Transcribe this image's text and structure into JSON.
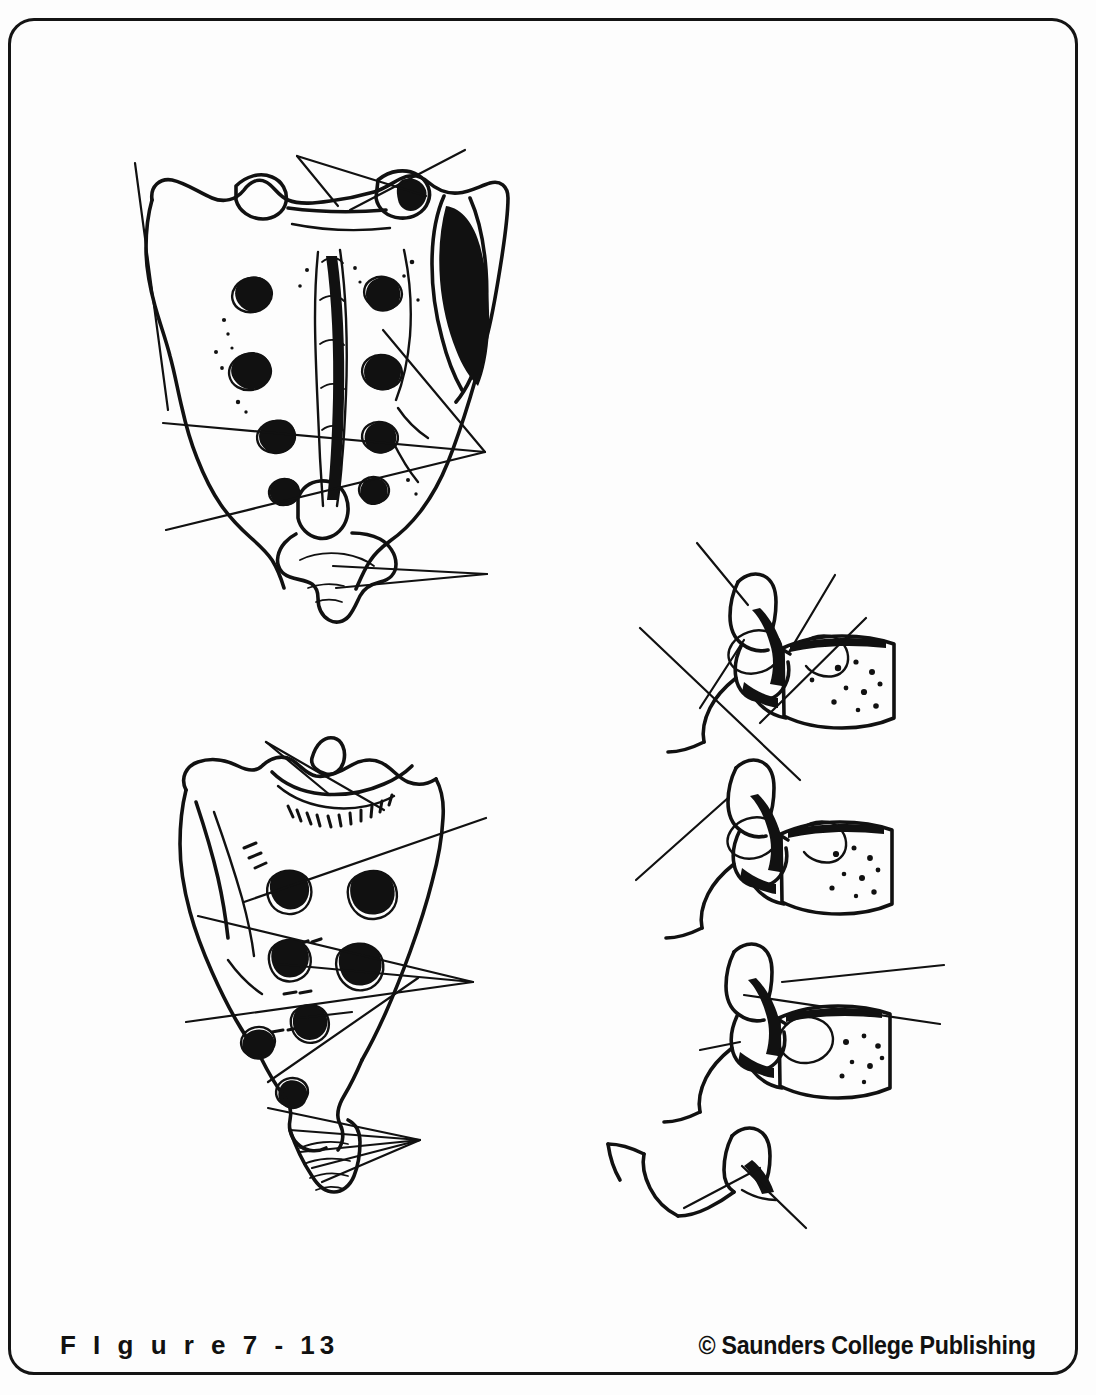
{
  "page": {
    "width": 1096,
    "height": 1395,
    "background_color": "#fdfdfd",
    "ink_color": "#111111",
    "border_color": "#141414"
  },
  "caption": {
    "figure_number": "F I g u r e   7 - 13",
    "copyright": "© Saunders College Publishing"
  },
  "figure": {
    "title_alt": "Unlabeled anatomy plate: sacrum and lumbar vertebrae with blank leader lines",
    "panels": [
      {
        "name": "sacrum-posterior-view",
        "position": "top-left",
        "description": "Sacrum seen from behind with median sacral crest, four pairs of posterior sacral foramina, auricular surface and coccyx",
        "leader_line_count": 8
      },
      {
        "name": "sacrum-anterolateral-view",
        "position": "middle-left",
        "description": "Sacrum seen obliquely with sacral promontory, transverse ridges, anterior sacral foramina and coccyx",
        "leader_line_count": 9
      },
      {
        "name": "lumbar-vertebrae-lateral-view",
        "position": "right",
        "description": "Four articulated lumbar vertebrae in lateral view showing bodies, spinous processes, articular processes and intervertebral foramina",
        "leader_line_count": 7
      }
    ]
  }
}
